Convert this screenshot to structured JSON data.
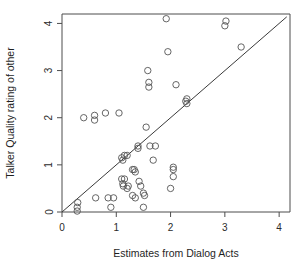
{
  "chart_data": {
    "type": "scatter",
    "title": "",
    "xlabel": "Estimates from Dialog Acts",
    "ylabel": "Talker Quality rating of other",
    "xlim": [
      0,
      4.2
    ],
    "ylim": [
      0,
      4.2
    ],
    "xticks": [
      0,
      1,
      2,
      3,
      4
    ],
    "yticks": [
      0,
      1,
      2,
      3,
      4
    ],
    "xticklabels": [
      "0",
      "1",
      "2",
      "3",
      "4"
    ],
    "yticklabels": [
      "0",
      "1",
      "2",
      "3",
      "4"
    ],
    "grid": false,
    "legend": false,
    "marker": "open-circle",
    "marker_color": "#555555",
    "annotations": [
      {
        "type": "line",
        "name": "identity-reference-line",
        "from": [
          0,
          0
        ],
        "to": [
          4.14,
          4.14
        ],
        "color": "#3a3a3a"
      }
    ],
    "points": [
      [
        0.28,
        0.02
      ],
      [
        0.28,
        0.1
      ],
      [
        0.29,
        0.2
      ],
      [
        0.4,
        2.0
      ],
      [
        0.6,
        1.95
      ],
      [
        0.6,
        2.05
      ],
      [
        0.62,
        0.3
      ],
      [
        0.8,
        2.1
      ],
      [
        0.85,
        0.3
      ],
      [
        0.95,
        0.3
      ],
      [
        0.9,
        0.1
      ],
      [
        1.05,
        2.1
      ],
      [
        1.1,
        1.15
      ],
      [
        1.12,
        1.1
      ],
      [
        1.15,
        1.2
      ],
      [
        1.2,
        1.2
      ],
      [
        1.1,
        0.7
      ],
      [
        1.12,
        0.6
      ],
      [
        1.13,
        0.55
      ],
      [
        1.15,
        0.7
      ],
      [
        1.2,
        0.5
      ],
      [
        1.22,
        0.55
      ],
      [
        1.3,
        0.9
      ],
      [
        1.33,
        0.9
      ],
      [
        1.35,
        0.85
      ],
      [
        1.3,
        0.35
      ],
      [
        1.35,
        0.3
      ],
      [
        1.4,
        1.4
      ],
      [
        1.4,
        1.35
      ],
      [
        1.42,
        0.65
      ],
      [
        1.45,
        0.55
      ],
      [
        1.5,
        0.4
      ],
      [
        1.52,
        0.35
      ],
      [
        1.5,
        0.1
      ],
      [
        1.55,
        1.8
      ],
      [
        1.58,
        3.0
      ],
      [
        1.6,
        2.65
      ],
      [
        1.6,
        2.75
      ],
      [
        1.62,
        1.4
      ],
      [
        1.72,
        1.4
      ],
      [
        1.68,
        1.1
      ],
      [
        1.92,
        4.1
      ],
      [
        1.95,
        3.4
      ],
      [
        2.0,
        0.5
      ],
      [
        2.05,
        0.9
      ],
      [
        2.05,
        0.95
      ],
      [
        2.05,
        0.75
      ],
      [
        2.1,
        2.7
      ],
      [
        2.28,
        2.35
      ],
      [
        2.3,
        2.3
      ],
      [
        2.3,
        2.4
      ],
      [
        3.0,
        3.95
      ],
      [
        3.02,
        4.05
      ],
      [
        3.3,
        3.5
      ]
    ]
  },
  "axis": {
    "x_label_text": "Estimates from Dialog Acts",
    "y_label_text": "Talker Quality rating of other"
  }
}
